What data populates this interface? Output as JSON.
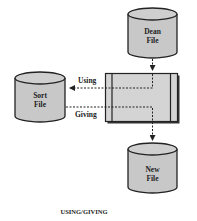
{
  "diagram": {
    "caption": "USING/GIVING",
    "nodes": {
      "dean_file": {
        "line1": "Dean",
        "line2": "File",
        "shape": "cylinder"
      },
      "sort_file": {
        "line1": "Sort",
        "line2": "File",
        "shape": "cylinder"
      },
      "new_file": {
        "line1": "New",
        "line2": "File",
        "shape": "cylinder"
      },
      "sort_process": {
        "shape": "predefined-process-box"
      }
    },
    "edges": [
      {
        "from": "dean_file",
        "to": "sort_process",
        "style": "dashed-arrow"
      },
      {
        "from": "sort_process",
        "to": "sort_file",
        "label": "Using",
        "style": "dashed-arrow"
      },
      {
        "from": "sort_file",
        "to": "new_file",
        "label": "Giving",
        "via": "sort_process",
        "style": "dashed-arrow"
      }
    ],
    "labels": {
      "using": "Using",
      "giving": "Giving"
    },
    "colors": {
      "cylinder_fill": "#c8c8c8",
      "box_fill": "#d4d4d4",
      "stroke": "#222222",
      "background": "#ffffff"
    }
  }
}
